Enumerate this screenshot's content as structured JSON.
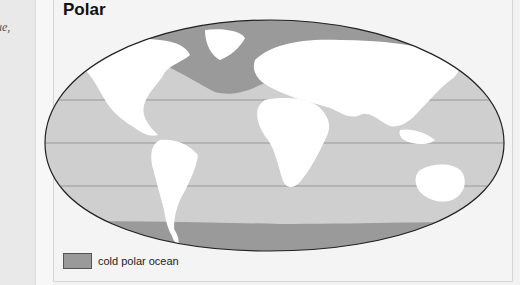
{
  "left_page": {
    "text": "ue,"
  },
  "figure": {
    "title": "Polar",
    "legend": [
      {
        "label": "cold polar ocean",
        "color": "#9a9a9a"
      }
    ],
    "colors": {
      "ocean": "#cfcfcf",
      "polar_ocean": "#9a9a9a",
      "land": "#ffffff",
      "outline": "#222222",
      "gridline": "#8a8a8a"
    },
    "latitude_lines": 3
  }
}
